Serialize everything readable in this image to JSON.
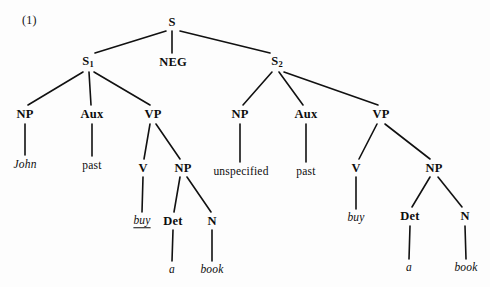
{
  "figure": {
    "number_label": "(1)",
    "number_pos": {
      "x": 22,
      "y": 14
    },
    "width": 490,
    "height": 287,
    "background_color": "#fdfdfd",
    "ink_color": "#111111"
  },
  "tree": {
    "type": "phrase-structure-tree",
    "root": "S",
    "description": "Conjoined S dominating S1, NEG, and S2",
    "nodes": [
      {
        "id": "s-root",
        "label": "S",
        "kind": "category",
        "x": 172,
        "y": 22
      },
      {
        "id": "s1",
        "label": "S",
        "sub": "1",
        "kind": "category",
        "x": 88,
        "y": 62
      },
      {
        "id": "neg",
        "label": "NEG",
        "kind": "category",
        "x": 173,
        "y": 62
      },
      {
        "id": "s2",
        "label": "S",
        "sub": "2",
        "kind": "category",
        "x": 277,
        "y": 62
      },
      {
        "id": "np-left",
        "label": "NP",
        "kind": "category",
        "x": 25,
        "y": 114
      },
      {
        "id": "aux-left",
        "label": "Aux",
        "kind": "category",
        "x": 92,
        "y": 114
      },
      {
        "id": "vp-left",
        "label": "VP",
        "kind": "category",
        "x": 153,
        "y": 114
      },
      {
        "id": "np-right",
        "label": "NP",
        "kind": "category",
        "x": 240,
        "y": 114
      },
      {
        "id": "aux-right",
        "label": "Aux",
        "kind": "category",
        "x": 306,
        "y": 114
      },
      {
        "id": "vp-right",
        "label": "VP",
        "kind": "category",
        "x": 381,
        "y": 114
      },
      {
        "id": "john",
        "label": "John",
        "kind": "terminal",
        "style": "italic",
        "x": 25,
        "y": 165
      },
      {
        "id": "past-left",
        "label": "past",
        "kind": "terminal",
        "style": "plain",
        "x": 92,
        "y": 166
      },
      {
        "id": "v-left",
        "label": "V",
        "kind": "category",
        "x": 143,
        "y": 168
      },
      {
        "id": "np2-left",
        "label": "NP",
        "kind": "category",
        "x": 183,
        "y": 168
      },
      {
        "id": "unspecified",
        "label": "unspecified",
        "kind": "terminal",
        "style": "plain",
        "x": 241,
        "y": 172
      },
      {
        "id": "past-right",
        "label": "past",
        "kind": "terminal",
        "style": "plain",
        "x": 306,
        "y": 172
      },
      {
        "id": "v-right",
        "label": "V",
        "kind": "category",
        "x": 356,
        "y": 168
      },
      {
        "id": "np2-right",
        "label": "NP",
        "kind": "category",
        "x": 434,
        "y": 168
      },
      {
        "id": "buy-left",
        "label": "buy",
        "kind": "terminal",
        "style": "italic-underlined",
        "x": 142,
        "y": 221
      },
      {
        "id": "det-left",
        "label": "Det",
        "kind": "category",
        "x": 173,
        "y": 221
      },
      {
        "id": "n-left",
        "label": "N",
        "kind": "category",
        "x": 212,
        "y": 221
      },
      {
        "id": "buy-right",
        "label": "buy",
        "kind": "terminal",
        "style": "italic",
        "x": 356,
        "y": 218
      },
      {
        "id": "det-right",
        "label": "Det",
        "kind": "category",
        "x": 410,
        "y": 216
      },
      {
        "id": "n-right",
        "label": "N",
        "kind": "category",
        "x": 465,
        "y": 216
      },
      {
        "id": "a-left",
        "label": "a",
        "kind": "terminal",
        "style": "italic",
        "x": 172,
        "y": 270
      },
      {
        "id": "book-left",
        "label": "book",
        "kind": "terminal",
        "style": "italic",
        "x": 212,
        "y": 270
      },
      {
        "id": "a-right",
        "label": "a",
        "kind": "terminal",
        "style": "italic",
        "x": 409,
        "y": 268
      },
      {
        "id": "book-right",
        "label": "book",
        "kind": "terminal",
        "style": "italic",
        "x": 466,
        "y": 268
      }
    ],
    "edges": [
      {
        "from": "s-root",
        "to": "s1",
        "x1": 166,
        "y1": 31,
        "x2": 95,
        "y2": 53
      },
      {
        "from": "s-root",
        "to": "neg",
        "x1": 172,
        "y1": 31,
        "x2": 172,
        "y2": 53
      },
      {
        "from": "s-root",
        "to": "s2",
        "x1": 180,
        "y1": 31,
        "x2": 270,
        "y2": 53
      },
      {
        "from": "s1",
        "to": "np-left",
        "x1": 83,
        "y1": 72,
        "x2": 28,
        "y2": 105
      },
      {
        "from": "s1",
        "to": "aux-left",
        "x1": 89,
        "y1": 72,
        "x2": 91,
        "y2": 105
      },
      {
        "from": "s1",
        "to": "vp-left",
        "x1": 94,
        "y1": 72,
        "x2": 150,
        "y2": 105
      },
      {
        "from": "s2",
        "to": "np-right",
        "x1": 272,
        "y1": 72,
        "x2": 243,
        "y2": 105
      },
      {
        "from": "s2",
        "to": "aux-right",
        "x1": 279,
        "y1": 72,
        "x2": 303,
        "y2": 105
      },
      {
        "from": "s2",
        "to": "vp-right",
        "x1": 284,
        "y1": 72,
        "x2": 378,
        "y2": 105
      },
      {
        "from": "np-left",
        "to": "john",
        "x1": 25,
        "y1": 124,
        "x2": 25,
        "y2": 155
      },
      {
        "from": "aux-left",
        "to": "past-left",
        "x1": 92,
        "y1": 124,
        "x2": 92,
        "y2": 156
      },
      {
        "from": "vp-left",
        "to": "v-left",
        "x1": 150,
        "y1": 124,
        "x2": 144,
        "y2": 159
      },
      {
        "from": "vp-left",
        "to": "np2-left",
        "x1": 156,
        "y1": 124,
        "x2": 180,
        "y2": 159
      },
      {
        "from": "np-right",
        "to": "unspecified",
        "x1": 240,
        "y1": 124,
        "x2": 240,
        "y2": 162
      },
      {
        "from": "aux-right",
        "to": "past-right",
        "x1": 306,
        "y1": 124,
        "x2": 306,
        "y2": 162
      },
      {
        "from": "vp-right",
        "to": "v-right",
        "x1": 377,
        "y1": 124,
        "x2": 359,
        "y2": 159
      },
      {
        "from": "vp-right",
        "to": "np2-right",
        "x1": 385,
        "y1": 124,
        "x2": 430,
        "y2": 159
      },
      {
        "from": "v-left",
        "to": "buy-left",
        "x1": 143,
        "y1": 177,
        "x2": 142,
        "y2": 212
      },
      {
        "from": "np2-left",
        "to": "det-left",
        "x1": 180,
        "y1": 177,
        "x2": 174,
        "y2": 212
      },
      {
        "from": "np2-left",
        "to": "n-left",
        "x1": 187,
        "y1": 177,
        "x2": 211,
        "y2": 212
      },
      {
        "from": "v-right",
        "to": "buy-right",
        "x1": 356,
        "y1": 177,
        "x2": 356,
        "y2": 209
      },
      {
        "from": "np2-right",
        "to": "det-right",
        "x1": 430,
        "y1": 177,
        "x2": 412,
        "y2": 207
      },
      {
        "from": "np2-right",
        "to": "n-right",
        "x1": 438,
        "y1": 177,
        "x2": 462,
        "y2": 207
      },
      {
        "from": "det-left",
        "to": "a-left",
        "x1": 173,
        "y1": 230,
        "x2": 172,
        "y2": 261
      },
      {
        "from": "n-left",
        "to": "book-left",
        "x1": 212,
        "y1": 230,
        "x2": 212,
        "y2": 261
      },
      {
        "from": "det-right",
        "to": "a-right",
        "x1": 410,
        "y1": 226,
        "x2": 409,
        "y2": 259
      },
      {
        "from": "n-right",
        "to": "book-right",
        "x1": 465,
        "y1": 226,
        "x2": 466,
        "y2": 259
      }
    ]
  }
}
